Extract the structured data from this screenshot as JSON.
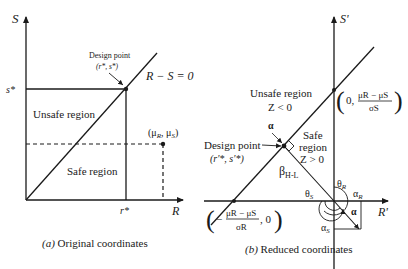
{
  "left_panel": {
    "caption_prefix": "(a)",
    "caption_text": " Original coordinates",
    "axis_y_label": "S",
    "axis_x_label": "R",
    "s_star_label": "s*",
    "r_star_label": "r*",
    "design_point_label": "Design point",
    "design_point_coords": "(r*, s*)",
    "limit_state_label": "R − S = 0",
    "unsafe_region_label": "Unsafe region",
    "safe_region_label": "Safe region",
    "mean_point_label": "(μR, μS)",
    "mean_point_mu": "μ",
    "mean_point_R": "R",
    "mean_point_S": "S"
  },
  "right_panel": {
    "caption_prefix": "(b)",
    "caption_text": " Reduced coordinates",
    "axis_y_label": "S'",
    "axis_x_label": "R'",
    "unsafe_region_label": "Unsafe region",
    "unsafe_condition": "Z < 0",
    "safe_region_label_1": "Safe",
    "safe_region_label_2": "region",
    "safe_condition": "Z > 0",
    "design_point_label": "Design point",
    "design_point_coords": "(r'*, s'*)",
    "alpha_label": "α",
    "beta_label": "β",
    "beta_subscript": "H-L",
    "theta_s_label": "θ",
    "theta_s_sub": "S",
    "theta_r_label": "θ",
    "theta_r_sub": "R",
    "alpha_r_label": "α",
    "alpha_r_sub": "R",
    "alpha_s_label": "α",
    "alpha_s_sub": "S",
    "alpha_vector_label": "α",
    "s_intercept_zero": "0,",
    "s_intercept_num": "μR − μS",
    "s_intercept_den": "σS",
    "r_intercept_minus": "−",
    "r_intercept_num": "μR − μS",
    "r_intercept_den": "σR",
    "r_intercept_zero": ", 0"
  }
}
